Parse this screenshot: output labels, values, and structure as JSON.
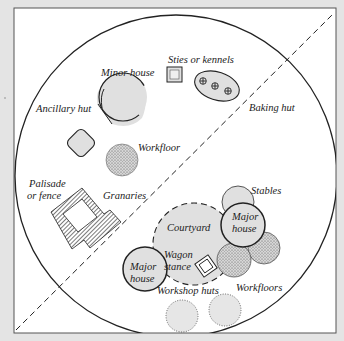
{
  "diagram": {
    "colors": {
      "background": "#e4e4e4",
      "panel": "#ffffff",
      "fill_grey": "#d9d9d9",
      "stroke": "#222222"
    },
    "labels": {
      "minor_house": "Minor house",
      "sties": "Sties or kennels",
      "baking_hut": "Baking hut",
      "ancillary_hut": "Ancillary hut",
      "workfloor": "Workfloor",
      "palisade_1": "Palisade",
      "palisade_2": "or fence",
      "granaries": "Granaries",
      "stables": "Stables",
      "courtyard": "Courtyard",
      "major_house_1": "Major",
      "major_house_2": "house",
      "wagon_1": "Wagon",
      "wagon_2": "stance",
      "workshop_huts": "Workshop huts",
      "workfloors": "Workfloors"
    }
  }
}
